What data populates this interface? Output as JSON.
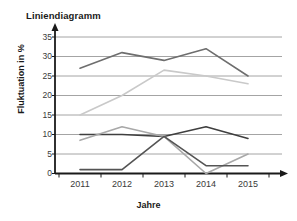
{
  "chart_data": {
    "type": "line",
    "title": "Liniendiagramm",
    "xlabel": "Jahre",
    "ylabel": "Fluktuation in %",
    "categories": [
      "2011",
      "2012",
      "2013",
      "2014",
      "2015"
    ],
    "yticks": [
      "0",
      "5",
      "10",
      "15",
      "20",
      "25",
      "30",
      "35"
    ],
    "ylim": [
      0,
      35
    ],
    "grid": true,
    "legend": "none",
    "series": [
      {
        "name": "Serie 1",
        "color": "#6e6e6e",
        "values": [
          27,
          31,
          29,
          32,
          25
        ]
      },
      {
        "name": "Serie 2",
        "color": "#c9c9c9",
        "values": [
          15,
          20,
          26.5,
          25,
          23
        ]
      },
      {
        "name": "Serie 3",
        "color": "#3f3f3f",
        "values": [
          10,
          10,
          9.5,
          12,
          9
        ]
      },
      {
        "name": "Serie 4",
        "color": "#a8a8a8",
        "values": [
          8.5,
          12,
          9.5,
          0,
          5
        ]
      },
      {
        "name": "Serie 5",
        "color": "#545454",
        "values": [
          1,
          1,
          9.5,
          2,
          2
        ]
      }
    ]
  },
  "axis": {
    "y_tick_0": "0",
    "y_tick_1": "5",
    "y_tick_2": "10",
    "y_tick_3": "15",
    "y_tick_4": "20",
    "y_tick_5": "25",
    "y_tick_6": "30",
    "y_tick_7": "35",
    "x_tick_0": "2011",
    "x_tick_1": "2012",
    "x_tick_2": "2013",
    "x_tick_3": "2014",
    "x_tick_4": "2015"
  },
  "colors": {
    "gridline": "#9a9a9a",
    "axis": "#1a1a1a",
    "text": "#1a1a1a"
  }
}
